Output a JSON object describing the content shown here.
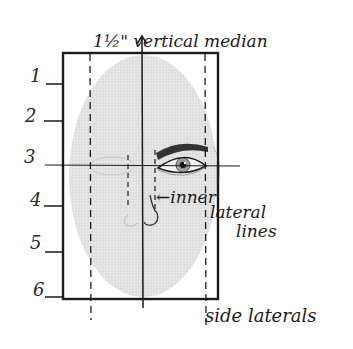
{
  "diagram": {
    "type": "face-proportion-grid",
    "colors": {
      "ink": "#1a1a1a",
      "face_fill": "#dcdcdc",
      "background": "#ffffff"
    },
    "labels": {
      "top": "1½\" vertical median",
      "inner_line_1": "←inner",
      "inner_line_2": "lateral",
      "inner_line_3": "lines",
      "bottom": "side laterals"
    },
    "row_numbers": [
      "1",
      "2",
      "3",
      "4",
      "5",
      "6"
    ],
    "frame": {
      "x": 63,
      "y": 53,
      "width": 155,
      "height": 246
    },
    "vertical_median_x": 142,
    "horizontal_eye_line_y": 165,
    "side_laterals_x": [
      90,
      206
    ],
    "inner_laterals_x": [
      128,
      157
    ],
    "tick_y": [
      84,
      121,
      165,
      206,
      252,
      297
    ]
  }
}
